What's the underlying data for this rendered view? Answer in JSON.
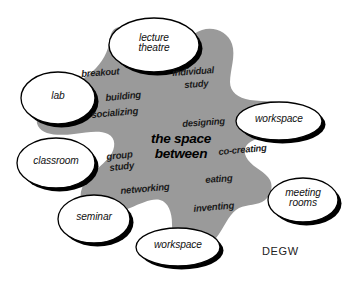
{
  "diagram": {
    "title": "the space between",
    "brand": "DEGW",
    "colors": {
      "background": "#ffffff",
      "blob_fill": "#9a9a9a",
      "node_fill": "#ffffff",
      "node_stroke": "#000000",
      "node_shadow": "#000000",
      "text": "#111111"
    },
    "center": {
      "line1": "the space",
      "line2": "between"
    },
    "blob_activities": [
      {
        "text": "breakout",
        "x": 81,
        "y": 69,
        "size": 9.4,
        "rotate": -4
      },
      {
        "text": "individual",
        "x": 172,
        "y": 68,
        "size": 9.4,
        "rotate": -4
      },
      {
        "text": "study",
        "x": 184,
        "y": 80,
        "size": 9.4,
        "rotate": -4
      },
      {
        "text": "building",
        "x": 105,
        "y": 93,
        "size": 9.6,
        "rotate": -5
      },
      {
        "text": "socializing",
        "x": 91,
        "y": 110,
        "size": 9.6,
        "rotate": -5
      },
      {
        "text": "designing",
        "x": 182,
        "y": 119,
        "size": 9.4,
        "rotate": -4
      },
      {
        "text": "co-creating",
        "x": 218,
        "y": 147,
        "size": 9.4,
        "rotate": -5
      },
      {
        "text": "group",
        "x": 106,
        "y": 152,
        "size": 9.6,
        "rotate": -6
      },
      {
        "text": "study",
        "x": 109,
        "y": 163,
        "size": 9.6,
        "rotate": -6
      },
      {
        "text": "eating",
        "x": 205,
        "y": 175,
        "size": 9.6,
        "rotate": -4
      },
      {
        "text": "networking",
        "x": 120,
        "y": 186,
        "size": 9.6,
        "rotate": -5
      },
      {
        "text": "inventing",
        "x": 193,
        "y": 204,
        "size": 9.6,
        "rotate": -5
      }
    ],
    "nodes": [
      {
        "id": "lecture-theatre",
        "lines": [
          "lecture",
          "theatre"
        ],
        "cx": 154,
        "cy": 45,
        "rx": 45,
        "ry": 27,
        "font_size": 10.2
      },
      {
        "id": "lab",
        "lines": [
          "lab"
        ],
        "cx": 58,
        "cy": 98,
        "rx": 37,
        "ry": 26,
        "font_size": 10.2
      },
      {
        "id": "classroom",
        "lines": [
          "classroom"
        ],
        "cx": 56,
        "cy": 163,
        "rx": 39,
        "ry": 25,
        "font_size": 10.2
      },
      {
        "id": "seminar",
        "lines": [
          "seminar"
        ],
        "cx": 94,
        "cy": 219,
        "rx": 36,
        "ry": 24,
        "font_size": 10.2
      },
      {
        "id": "workspace-bottom",
        "lines": [
          "workspace"
        ],
        "cx": 178,
        "cy": 247,
        "rx": 42,
        "ry": 19,
        "font_size": 10.2
      },
      {
        "id": "workspace-right",
        "lines": [
          "workspace"
        ],
        "cx": 279,
        "cy": 121,
        "rx": 43,
        "ry": 19,
        "font_size": 10.2
      },
      {
        "id": "meeting-rooms",
        "lines": [
          "meeting",
          "rooms"
        ],
        "cx": 303,
        "cy": 200,
        "rx": 35,
        "ry": 22,
        "font_size": 10.2
      }
    ],
    "blob_path": "M 108 48 C 104 60, 96 70, 84 78 C 72 86, 60 92, 50 100 C 40 108, 34 118, 38 126 C 43 135, 58 136, 74 134 C 88 132, 100 130, 108 134 C 116 138, 116 148, 110 156 C 102 166, 90 174, 84 184 C 78 194, 80 204, 90 210 C 100 216, 116 214, 130 208 C 142 203, 152 198, 160 200 C 168 202, 172 212, 172 224 C 172 236, 176 246, 186 250 C 196 254, 208 248, 216 238 C 224 228, 228 216, 236 210 C 244 204, 254 206, 262 202 C 270 198, 274 188, 270 180 C 266 172, 254 168, 248 160 C 242 152, 244 144, 254 140 C 266 135, 282 136, 292 130 C 302 124, 302 112, 292 106 C 282 100, 264 102, 250 100 C 238 98, 230 92, 230 82 C 230 70, 236 56, 232 44 C 228 32, 214 26, 202 30 C 190 34, 182 46, 176 56 C 170 66, 164 72, 156 70 C 148 68, 144 58, 140 46 C 136 34, 130 26, 120 27 C 110 28, 110 38, 108 48 Z"
  }
}
